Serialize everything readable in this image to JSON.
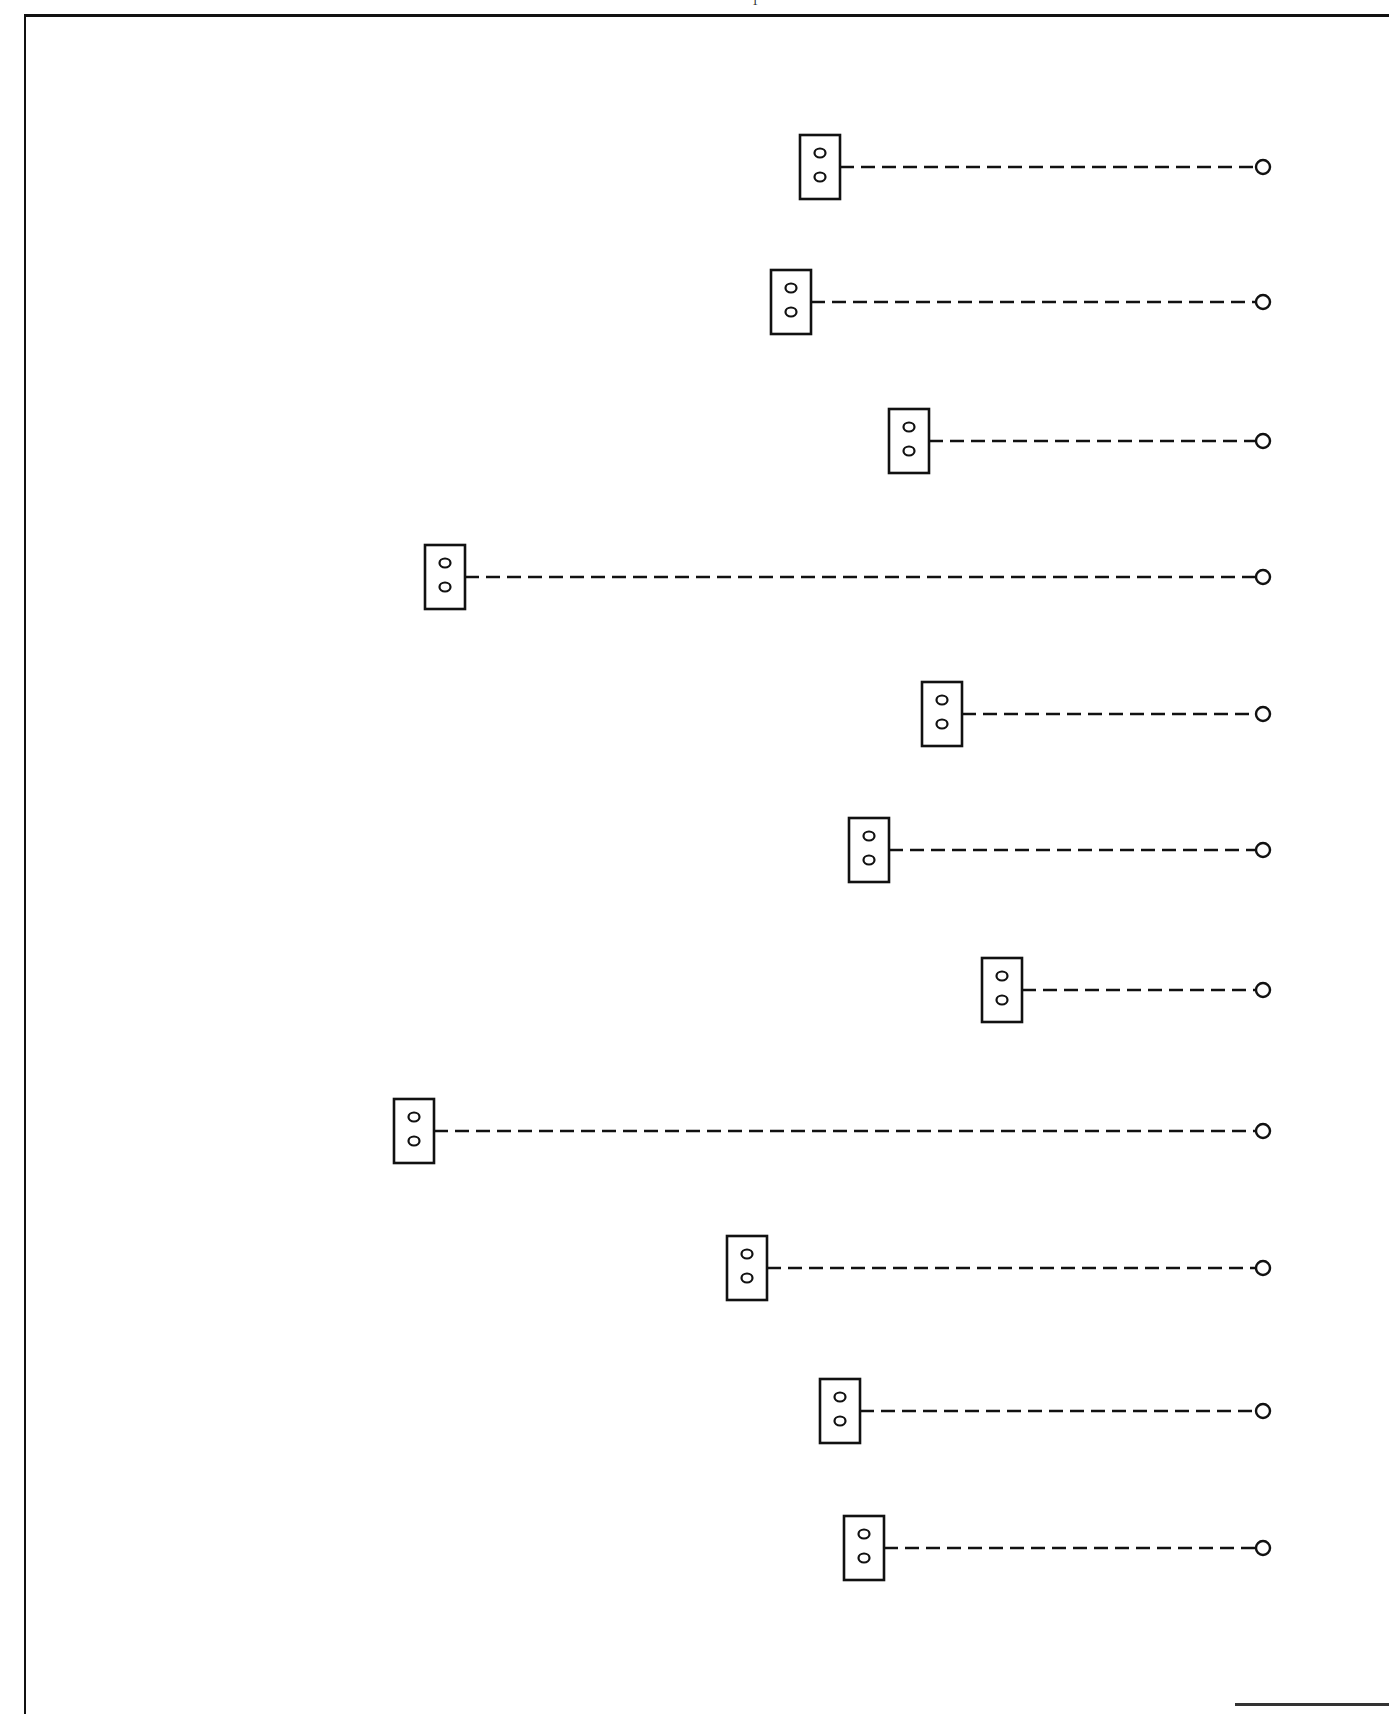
{
  "page": {
    "top_mark": "1"
  },
  "diagram": {
    "title": "",
    "stroke_color": "#111111",
    "background_color": "#ffffff",
    "terminal_x": 1263,
    "terminal_radius": 7,
    "box": {
      "width": 40,
      "height": 64
    },
    "rows": [
      {
        "id": 1,
        "box_x": 800,
        "center_y": 167
      },
      {
        "id": 2,
        "box_x": 771,
        "center_y": 302
      },
      {
        "id": 3,
        "box_x": 889,
        "center_y": 441
      },
      {
        "id": 4,
        "box_x": 425,
        "center_y": 577
      },
      {
        "id": 5,
        "box_x": 922,
        "center_y": 714
      },
      {
        "id": 6,
        "box_x": 849,
        "center_y": 850
      },
      {
        "id": 7,
        "box_x": 982,
        "center_y": 990
      },
      {
        "id": 8,
        "box_x": 394,
        "center_y": 1131
      },
      {
        "id": 9,
        "box_x": 727,
        "center_y": 1268
      },
      {
        "id": 10,
        "box_x": 820,
        "center_y": 1411
      },
      {
        "id": 11,
        "box_x": 844,
        "center_y": 1548
      }
    ],
    "legend": {
      "box_icon": "two-hole-socket-box-icon",
      "line_style": "dashed",
      "terminal_icon": "open-circle-terminal-icon"
    }
  }
}
